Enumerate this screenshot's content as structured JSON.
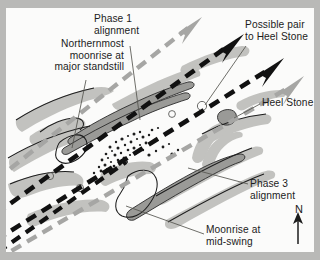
{
  "figure": {
    "background_color": "#b9b9b7",
    "plate_color": "#fbfbfa"
  },
  "colors": {
    "ink": "#1c1c1c",
    "stone_fill": "#bdbdbb",
    "stone_dark": "#8f8f8d",
    "alignment_black": "#111111",
    "alignment_grey": "#a6a6a4",
    "leader_line": "#5a5a58"
  },
  "labels": {
    "northernmost_moonrise": "Northernmost\nmoonrise at\nmajor standstill",
    "phase1_alignment": "Phase 1\nalignment",
    "possible_pair": "Possible pair\nto Heel Stone",
    "heel_stone": "Heel Stone",
    "phase3_alignment": "Phase 3\nalignment",
    "moonrise_midswing": "Moonrise at\nmid-swing",
    "north": "N"
  },
  "compass": {
    "letter": "N",
    "direction": "up",
    "arrow_glyph": "arrow-up-icon"
  },
  "alignments": [
    {
      "name": "possible-pair-to-heel-stone",
      "style": "dashed-grey",
      "arrow": true
    },
    {
      "name": "phase-1-alignment",
      "style": "dashed-black",
      "arrow": true
    },
    {
      "name": "heel-stone-axis",
      "style": "dashed-black",
      "arrow": true
    },
    {
      "name": "phase-3-alignment",
      "style": "dashed-grey",
      "arrow": true
    },
    {
      "name": "moonrise-at-mid-swing",
      "style": "dashed-black",
      "arrow": false
    }
  ]
}
